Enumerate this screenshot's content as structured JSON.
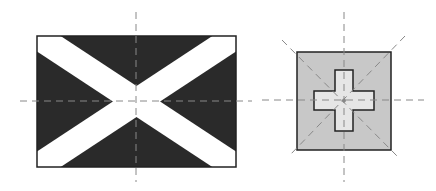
{
  "diagram": {
    "colors": {
      "dark_field": "#2a2a2a",
      "saltire": "#ffffff",
      "square_fill": "#c8c8c8",
      "cross_fill": "#e6e6e6",
      "outline": "#222222",
      "axis_line": "#888888"
    },
    "figures": [
      {
        "name": "saltire-flag",
        "shape": "rectangle with diagonal white cross",
        "axes": [
          "vertical",
          "horizontal"
        ]
      },
      {
        "name": "square-cross-flag",
        "shape": "square with centered plus cross",
        "axes": [
          "vertical",
          "horizontal",
          "diagonal-1",
          "diagonal-2"
        ]
      }
    ]
  }
}
